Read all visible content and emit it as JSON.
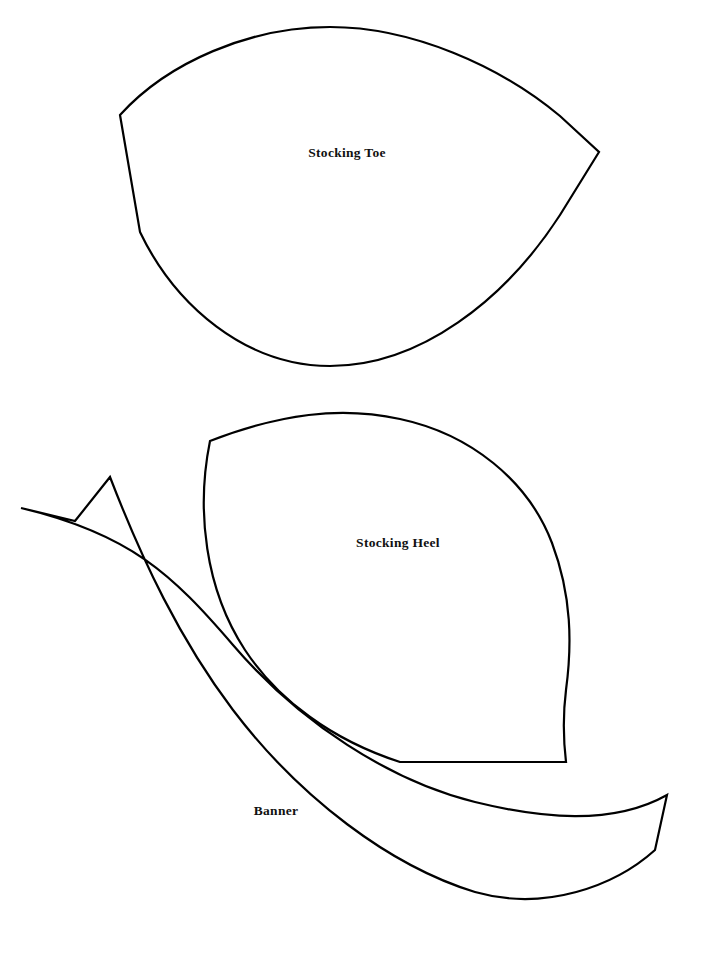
{
  "document": {
    "title": "Stocking Pattern Template Sheet",
    "background_color": "#ffffff",
    "ink_color": "#000000",
    "page_width": 708,
    "page_height": 957
  },
  "pieces": [
    {
      "id": "stocking-toe",
      "label": "Stocking Toe",
      "label_x": 347,
      "label_y": 154,
      "shape": "pointed-oval-leaf",
      "stroke": "#000000",
      "fill": "#ffffff",
      "path": "M 120 115 C 168 62 250 27 330 27 C 412 27 500 66 560 116 L 599 152 L 560 215 C 505 300 420 366 330 366 C 245 366 175 305 140 232 Z"
    },
    {
      "id": "stocking-heel",
      "label": "Stocking Heel",
      "label_x": 398,
      "label_y": 544,
      "shape": "asymmetric-leaf",
      "stroke": "#000000",
      "fill": "#ffffff",
      "path": "M 210 441 C 280 414 340 406 400 419 C 470 434 528 480 552 543 C 572 596 572 645 566 690 C 562 722 564 745 566 762 L 400 762 C 332 740 278 700 245 650 C 205 589 196 510 210 441 Z"
    },
    {
      "id": "banner",
      "label": "Banner",
      "label_x": 276,
      "label_y": 812,
      "shape": "curved-ribbon-swallowtail",
      "stroke": "#000000",
      "fill": "#ffffff",
      "path": "M 21 508 L 75 521 L 110 477 C 142 560 180 640 233 710 C 300 798 390 866 475 892 C 545 912 615 886 655 850 L 667 795 C 612 826 540 818 475 802 C 390 781 300 723 233 645 C 172 574 130 534 21 508 Z"
    }
  ],
  "labels": {
    "toe": "Stocking Toe",
    "heel": "Stocking Heel",
    "banner": "Banner"
  }
}
